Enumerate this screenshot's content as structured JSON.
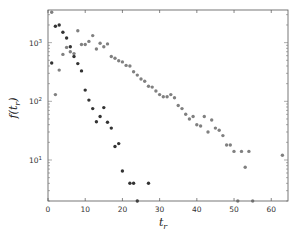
{
  "chart_data": {
    "type": "scatter",
    "title": "",
    "xlabel": "t_r",
    "ylabel": "f(t_r)",
    "xscale": "linear",
    "yscale": "log",
    "xlim": [
      0,
      64.5
    ],
    "ylim": [
      2,
      3600
    ],
    "grid": false,
    "legend": null,
    "x_ticks": [
      0,
      10,
      20,
      30,
      40,
      50,
      60
    ],
    "x_tick_labels": [
      "0",
      "10",
      "20",
      "30",
      "40",
      "50",
      "60"
    ],
    "y_ticks": [
      10,
      100,
      1000
    ],
    "y_tick_labels": [
      "10^1",
      "10^2",
      "10^3"
    ],
    "series": [
      {
        "name": "dark",
        "color": "#333333",
        "points": [
          [
            1,
            450
          ],
          [
            2,
            1900
          ],
          [
            3,
            2000
          ],
          [
            4,
            1500
          ],
          [
            5,
            1200
          ],
          [
            6,
            850
          ],
          [
            7,
            580
          ],
          [
            8,
            440
          ],
          [
            9,
            330
          ],
          [
            10,
            155
          ],
          [
            11,
            105
          ],
          [
            12,
            75
          ],
          [
            13,
            45
          ],
          [
            14,
            55
          ],
          [
            15,
            78
          ],
          [
            16,
            44
          ],
          [
            17,
            35
          ],
          [
            18,
            17
          ],
          [
            19,
            19
          ],
          [
            20,
            6.5
          ],
          [
            22,
            4
          ],
          [
            23,
            4
          ],
          [
            24,
            2
          ],
          [
            27,
            4
          ]
        ]
      },
      {
        "name": "gray",
        "color": "#808080",
        "points": [
          [
            1,
            3300
          ],
          [
            2,
            130
          ],
          [
            3,
            340
          ],
          [
            4,
            630
          ],
          [
            5,
            830
          ],
          [
            6,
            700
          ],
          [
            7,
            650
          ],
          [
            8,
            1600
          ],
          [
            9,
            930
          ],
          [
            10,
            930
          ],
          [
            11,
            1050
          ],
          [
            12,
            1320
          ],
          [
            13,
            780
          ],
          [
            14,
            980
          ],
          [
            15,
            850
          ],
          [
            16,
            950
          ],
          [
            17,
            580
          ],
          [
            18,
            540
          ],
          [
            19,
            490
          ],
          [
            20,
            470
          ],
          [
            21,
            410
          ],
          [
            22,
            400
          ],
          [
            23,
            320
          ],
          [
            24,
            280
          ],
          [
            25,
            240
          ],
          [
            26,
            220
          ],
          [
            27,
            180
          ],
          [
            28,
            175
          ],
          [
            29,
            150
          ],
          [
            30,
            130
          ],
          [
            31,
            120
          ],
          [
            32,
            120
          ],
          [
            33,
            130
          ],
          [
            34,
            115
          ],
          [
            35,
            85
          ],
          [
            36,
            75
          ],
          [
            37,
            60
          ],
          [
            38,
            50
          ],
          [
            39,
            55
          ],
          [
            40,
            40
          ],
          [
            41,
            38
          ],
          [
            42,
            55
          ],
          [
            43,
            30
          ],
          [
            44,
            48
          ],
          [
            45,
            35
          ],
          [
            46,
            32
          ],
          [
            47,
            26
          ],
          [
            48,
            18
          ],
          [
            49,
            18
          ],
          [
            50,
            14
          ],
          [
            51,
            2
          ],
          [
            52,
            14
          ],
          [
            53,
            7.5
          ],
          [
            54,
            14
          ],
          [
            55,
            2
          ],
          [
            63,
            12
          ]
        ]
      }
    ]
  }
}
